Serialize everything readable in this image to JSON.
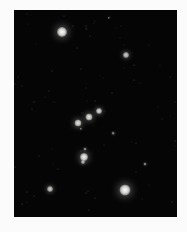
{
  "image": {
    "subject": "Orion constellation night sky photograph",
    "background_color": "#fbfbfb",
    "sky_color": "#050505",
    "frame": {
      "left": 14,
      "top": 10,
      "width": 163,
      "height": 207
    }
  },
  "stars": [
    {
      "name": "betelgeuse",
      "x": 62,
      "y": 32,
      "r": 5,
      "brightness": 1.0
    },
    {
      "name": "bellatrix",
      "x": 126,
      "y": 55,
      "r": 3,
      "brightness": 0.8
    },
    {
      "name": "meissa",
      "x": 109,
      "y": 18,
      "r": 1.2,
      "brightness": 0.45
    },
    {
      "name": "mintaka",
      "x": 99,
      "y": 111,
      "r": 3,
      "brightness": 0.85
    },
    {
      "name": "alnilam",
      "x": 89,
      "y": 117,
      "r": 3.5,
      "brightness": 0.9
    },
    {
      "name": "alnitak",
      "x": 78,
      "y": 123,
      "r": 3.5,
      "brightness": 0.9
    },
    {
      "name": "belt-faint",
      "x": 81,
      "y": 129,
      "r": 1.2,
      "brightness": 0.5
    },
    {
      "name": "sword-upper",
      "x": 85,
      "y": 149,
      "r": 1.5,
      "brightness": 0.55
    },
    {
      "name": "orion-nebula",
      "x": 84,
      "y": 157,
      "r": 4,
      "brightness": 0.95
    },
    {
      "name": "sword-lower",
      "x": 83,
      "y": 162,
      "r": 2,
      "brightness": 0.7
    },
    {
      "name": "faint-mid-right",
      "x": 113,
      "y": 133,
      "r": 1.3,
      "brightness": 0.5
    },
    {
      "name": "faint-lower-right",
      "x": 145,
      "y": 164,
      "r": 1.5,
      "brightness": 0.55
    },
    {
      "name": "saiph",
      "x": 50,
      "y": 189,
      "r": 3,
      "brightness": 0.8
    },
    {
      "name": "rigel",
      "x": 125,
      "y": 190,
      "r": 5.5,
      "brightness": 1.0
    }
  ]
}
